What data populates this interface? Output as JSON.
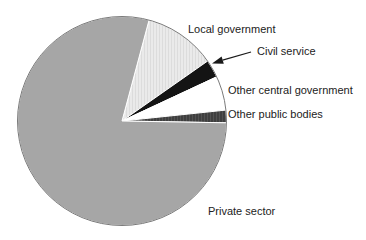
{
  "chart_data": {
    "type": "pie",
    "title": "",
    "legend": "none",
    "unit": "percent",
    "categories": [
      "Local government",
      "Civil service",
      "Other central government",
      "Other public bodies",
      "Private sector"
    ],
    "values": [
      11.1,
      2.8,
      5.3,
      1.9,
      78.9
    ],
    "slices": [
      {
        "label": "Local government",
        "value_pct": 11.1,
        "start_deg": 15,
        "end_deg": 55,
        "fill": "#eaeaea",
        "pattern": "light-stipple"
      },
      {
        "label": "Civil service",
        "value_pct": 2.8,
        "start_deg": 55,
        "end_deg": 65,
        "fill": "#141414",
        "pattern": "none"
      },
      {
        "label": "Other central government",
        "value_pct": 5.3,
        "start_deg": 65,
        "end_deg": 84,
        "fill": "#ffffff",
        "pattern": "none"
      },
      {
        "label": "Other public bodies",
        "value_pct": 1.9,
        "start_deg": 84,
        "end_deg": 91,
        "fill": "#3f3f3f",
        "pattern": "dark-stipple"
      },
      {
        "label": "Private sector",
        "value_pct": 78.9,
        "start_deg": 91,
        "end_deg": 375,
        "fill": "#a6a6a6",
        "pattern": "none"
      }
    ],
    "annotation": {
      "arrow_target_slice": "Civil service"
    },
    "colors": {
      "outline": "#7a7a7a",
      "separator": "#ffffff",
      "label_text": "#222222",
      "arrow": "#1a1a1a"
    }
  }
}
